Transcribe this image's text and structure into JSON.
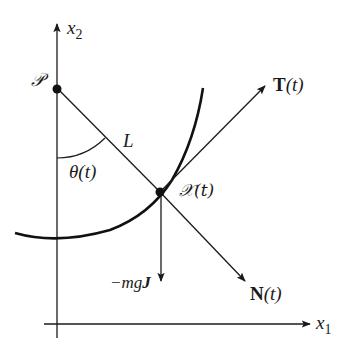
{
  "diagram": {
    "type": "pendulum-on-curve",
    "axes": {
      "vertical_label": {
        "base": "x",
        "subscript": "2"
      },
      "horizontal_label": {
        "base": "x",
        "subscript": "1"
      }
    },
    "pivot_label": "𝒫",
    "length_label": "L",
    "angle_label": "θ(t)",
    "position_label": "𝒳(t)",
    "tangent_label": {
      "vec": "T",
      "arg": "(t)"
    },
    "normal_label": {
      "vec": "N",
      "arg": "(t)"
    },
    "gravity_label": {
      "prefix": "−mg",
      "vec": "J"
    },
    "colors": {
      "ink": "#1a1a1a",
      "background": "#ffffff"
    }
  }
}
